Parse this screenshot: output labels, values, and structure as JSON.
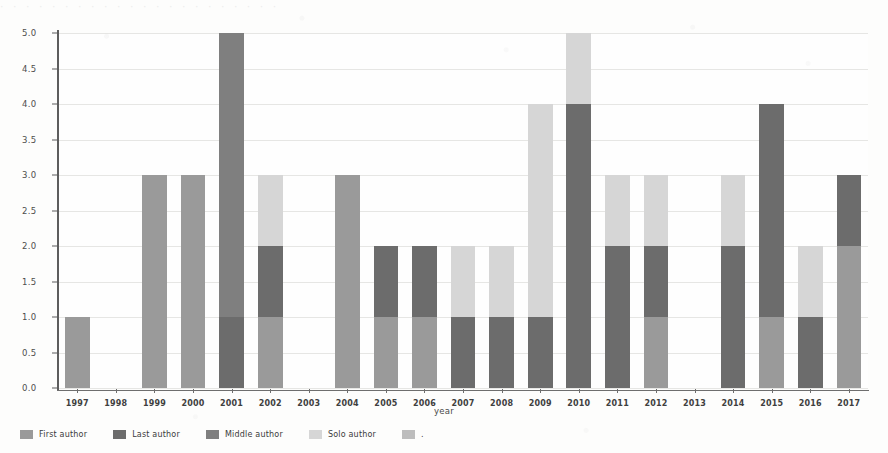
{
  "page": {
    "background_color": "#fdfdfc",
    "ghost_header_text": "· ·  ·   ·  ·    ·  ·   ·    ·  ·  ·   ·  ·   ·    ·  ·   ·  ·   ·    ·  ·   ·"
  },
  "axes": {
    "ylabel": "number_of_publications",
    "xlabel": "year",
    "yticks": [
      "0.0",
      "0.5",
      "1.0",
      "1.5",
      "2.0",
      "2.5",
      "3.0",
      "3.5",
      "4.0",
      "4.5",
      "5.0"
    ]
  },
  "legend": {
    "items": [
      {
        "label": "First author",
        "color": "#9a9a9a"
      },
      {
        "label": "Last author",
        "color": "#6c6c6c"
      },
      {
        "label": "Middle author",
        "color": "#7f7f7f"
      },
      {
        "label": "Solo author",
        "color": "#d6d6d6"
      },
      {
        "label": ".",
        "color": "#bdbdbd"
      }
    ]
  },
  "chart_data": {
    "type": "bar",
    "title": "",
    "xlabel": "year",
    "ylabel": "number_of_publications",
    "ylim": [
      0,
      5
    ],
    "ytick_step": 0.5,
    "grid": true,
    "stacked": true,
    "legend_position": "bottom-left",
    "categories": [
      "1997",
      "1998",
      "1999",
      "2000",
      "2001",
      "2002",
      "2003",
      "2004",
      "2005",
      "2006",
      "2007",
      "2008",
      "2009",
      "2010",
      "2011",
      "2012",
      "2013",
      "2014",
      "2015",
      "2016",
      "2017"
    ],
    "series": [
      {
        "name": "First author",
        "color": "#9a9a9a",
        "values": [
          1,
          0,
          3,
          3,
          0,
          1,
          0,
          3,
          1,
          1,
          0,
          0,
          0,
          0,
          0,
          1,
          0,
          0,
          1,
          0,
          2
        ]
      },
      {
        "name": "Last author",
        "color": "#6c6c6c",
        "values": [
          0,
          0,
          0,
          0,
          1,
          1,
          0,
          0,
          1,
          1,
          1,
          1,
          1,
          4,
          2,
          1,
          0,
          2,
          3,
          1,
          1
        ]
      },
      {
        "name": "Middle author",
        "color": "#7f7f7f",
        "values": [
          0,
          0,
          0,
          0,
          4,
          0,
          0,
          0,
          0,
          0,
          0,
          0,
          0,
          0,
          0,
          0,
          0,
          0,
          0,
          0,
          0
        ]
      },
      {
        "name": "Solo author",
        "color": "#d6d6d6",
        "values": [
          0,
          0,
          0,
          0,
          0,
          1,
          0,
          0,
          0,
          0,
          1,
          1,
          3,
          1,
          1,
          1,
          0,
          1,
          0,
          1,
          0
        ]
      }
    ],
    "totals": [
      1,
      0,
      3,
      3,
      5,
      3,
      0,
      3,
      2,
      2,
      2,
      2,
      4,
      5,
      3,
      3,
      0,
      3,
      4,
      2,
      3
    ]
  }
}
